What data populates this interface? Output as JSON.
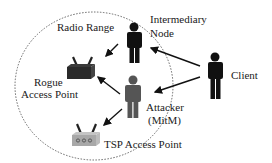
{
  "diagram": {
    "radio_range_label": "Radio Range",
    "nodes": {
      "intermediary": {
        "line1": "Intermediary",
        "line2": "Node",
        "color": "#111111"
      },
      "client": {
        "label": "Client",
        "color": "#111111"
      },
      "attacker": {
        "line1": "Attacker",
        "line2": "(MitM)",
        "color": "#555555"
      },
      "rogue_ap": {
        "line1": "Rogue",
        "line2": "Access Point",
        "color": "#2a2a2a"
      },
      "tsp_ap": {
        "label": "TSP Access Point",
        "color": "#a8a8a8"
      }
    },
    "edges": [
      {
        "from": "client",
        "to": "intermediary"
      },
      {
        "from": "client",
        "to": "attacker"
      },
      {
        "from": "intermediary",
        "to": "rogue_ap"
      },
      {
        "from": "attacker",
        "to": "rogue_ap"
      },
      {
        "from": "attacker",
        "to": "tsp_ap"
      }
    ]
  }
}
